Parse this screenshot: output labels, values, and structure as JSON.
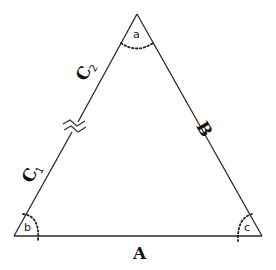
{
  "diagram": {
    "type": "triangle",
    "vertices": {
      "a": {
        "label": "a",
        "position": "top"
      },
      "b": {
        "label": "b",
        "position": "bottom-left"
      },
      "c": {
        "label": "c",
        "position": "bottom-right"
      }
    },
    "sides": {
      "A": {
        "label": "A",
        "between": [
          "b",
          "c"
        ]
      },
      "B": {
        "label": "B",
        "between": [
          "a",
          "c"
        ]
      },
      "C1": {
        "label": "C",
        "subscript": "1",
        "between": [
          "b",
          "break"
        ]
      },
      "C2": {
        "label": "C",
        "subscript": "2",
        "between": [
          "break",
          "a"
        ]
      }
    },
    "break_mark": "side C is split into segments C1 and C2 by a break symbol",
    "colors": {
      "stroke": "#2a2a2a",
      "background": "#ffffff"
    }
  }
}
